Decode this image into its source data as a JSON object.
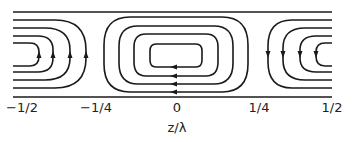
{
  "diagram": {
    "type": "streamline-vortex-pattern",
    "x_axis": {
      "label": "z/λ",
      "ticks": [
        "−1/2",
        "−1/4",
        "0",
        "1/4",
        "1/2"
      ]
    },
    "vortices": [
      {
        "position": "-1/2",
        "arrow_direction": "up",
        "streamlines": 4
      },
      {
        "position": "0",
        "arrow_direction": "left",
        "streamlines": 4
      },
      {
        "position": "1/2",
        "arrow_direction": "down",
        "streamlines": 4
      }
    ],
    "colors": {
      "line": "#1a1a1a",
      "background": "#ffffff"
    }
  }
}
